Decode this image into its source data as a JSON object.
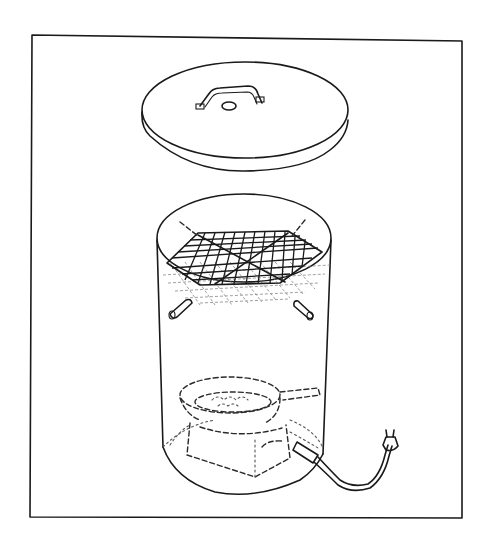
{
  "figure": {
    "title": "",
    "parts": [
      {
        "id": "lid",
        "label": "lid with handle"
      },
      {
        "id": "drum",
        "label": "cylindrical drum"
      },
      {
        "id": "rack",
        "label": "wire grill rack"
      },
      {
        "id": "pegs",
        "label": "rack support pegs"
      },
      {
        "id": "pan",
        "label": "pan with wood chips"
      },
      {
        "id": "hotplate",
        "label": "electric hot plate"
      },
      {
        "id": "cord",
        "label": "power cord and plug"
      }
    ],
    "colors": {
      "ink": "#1a1a1a",
      "background": "#ffffff"
    }
  }
}
